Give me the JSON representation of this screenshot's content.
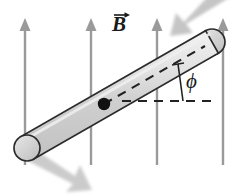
{
  "figure": {
    "background_color": "#ffffff"
  },
  "labels": {
    "field_symbol": "B",
    "field_vector_accent": "vector-arrow",
    "angle_symbol": "ϕ"
  },
  "field": {
    "name": "uniform-magnetic-field",
    "direction": "up",
    "color": "#9a9a9a",
    "arrow_count": 4,
    "arrows": [
      {
        "x": 25,
        "y_top": 20,
        "y_bottom": 165
      },
      {
        "x": 91,
        "y_top": 20,
        "y_bottom": 165
      },
      {
        "x": 157,
        "y_top": 20,
        "y_bottom": 165
      },
      {
        "x": 223,
        "y_top": 20,
        "y_bottom": 165
      }
    ]
  },
  "rod": {
    "name": "cylindrical-rod",
    "fill_color": "#d2d2d2",
    "outline_color": "#2b2b2b",
    "highlight_color": "#eaeaea",
    "end_low": {
      "x": 27,
      "y": 148
    },
    "end_high": {
      "x": 212,
      "y": 42
    },
    "radius": 13,
    "tilt_degrees": 30
  },
  "pivot": {
    "name": "pivot-point",
    "x": 104,
    "y": 104,
    "radius": 6,
    "color": "#111111"
  },
  "axis_line": {
    "name": "rod-axis-dashed-line",
    "color": "#222222",
    "dash": "9 7"
  },
  "reference_line": {
    "name": "horizontal-reference-dashed-line",
    "color": "#222222",
    "dash": "9 7",
    "y": 101,
    "x_start": 122,
    "x_end": 214
  },
  "angle_marker": {
    "name": "angle-vertex-tick",
    "color": "#222222",
    "value_symbol": "ϕ"
  },
  "motion_arrows": {
    "name": "rotation-motion-arrows",
    "color": "#b9b9b9",
    "count": 2,
    "items": [
      {
        "id": "top-right-motion-arrow",
        "direction": "down-left"
      },
      {
        "id": "bottom-left-motion-arrow",
        "direction": "down-right"
      }
    ]
  }
}
